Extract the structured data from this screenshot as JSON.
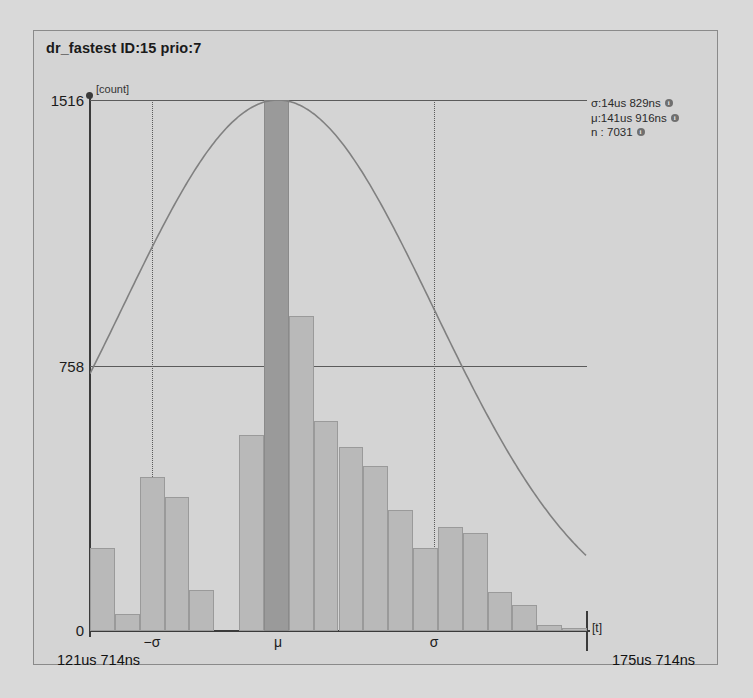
{
  "panel": {
    "title": "dr_fastest ID:15 prio:7"
  },
  "axes": {
    "y_unit": "[count]",
    "x_unit": "[t]",
    "y_top_label": "1516",
    "y_mid_label": "758",
    "y_zero_label": "0",
    "x_left_bound": "121us 714ns",
    "x_right_bound": "175us 714ns",
    "x_ticks": [
      {
        "label": "−σ",
        "name": "tick-minus-sigma"
      },
      {
        "label": "μ",
        "name": "tick-mu"
      },
      {
        "label": "σ",
        "name": "tick-sigma"
      }
    ]
  },
  "legend": {
    "sigma": "σ:14us 829ns",
    "mu": "μ:141us 916ns",
    "n": "n : 7031",
    "info_icon": "i"
  },
  "colors": {
    "panel_bg": "#d4d4d4",
    "page_bg": "#d9d9d9",
    "bar_fill": "#b9b9b9",
    "bar_highlight": "#9a9a9a",
    "axis": "#3a3a3a",
    "grid": "#5b5b5b",
    "curve": "#808080"
  },
  "chart_data": {
    "type": "bar",
    "title": "dr_fastest ID:15 prio:7",
    "xlabel": "[t]",
    "ylabel": "[count]",
    "ylim": [
      0,
      1516
    ],
    "xlim_labels": [
      "121us 714ns",
      "175us 714ns"
    ],
    "grid": true,
    "legend_position": "top-right",
    "statistics": {
      "sigma": "14us 829ns",
      "mu": "141us 916ns",
      "n": 7031
    },
    "annotations": [
      {
        "label": "−σ",
        "x_fraction": 0.125
      },
      {
        "label": "μ",
        "x_fraction": 0.378
      },
      {
        "label": "σ",
        "x_fraction": 0.692
      }
    ],
    "bin_count": 20,
    "categories": [
      "bin-1",
      "bin-2",
      "bin-3",
      "bin-4",
      "bin-5",
      "bin-6",
      "bin-7",
      "bin-8",
      "bin-9",
      "bin-10",
      "bin-11",
      "bin-12",
      "bin-13",
      "bin-14",
      "bin-15",
      "bin-16",
      "bin-17",
      "bin-18",
      "bin-19",
      "bin-20"
    ],
    "values": [
      236,
      48,
      440,
      382,
      118,
      0,
      560,
      1516,
      900,
      600,
      524,
      470,
      346,
      236,
      296,
      280,
      110,
      74,
      16,
      10
    ],
    "highlight_index": 7,
    "overlay": {
      "type": "line",
      "name": "gaussian-fit",
      "peak_value": 1516,
      "peak_x_fraction": 0.378
    }
  }
}
